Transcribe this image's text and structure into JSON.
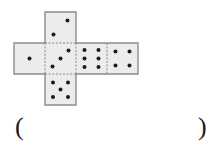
{
  "figure": {
    "style": {
      "face_fill": "#ececec",
      "outer_stroke": "#8c8c8c",
      "fold_stroke": "#7a7a7a",
      "pip_color": "#1a1a1a",
      "background": "#ffffff"
    },
    "geometry": {
      "cell_size": 31,
      "origin_x": 14,
      "origin_y": 12,
      "columns": 4,
      "rows": 3
    },
    "faces": [
      {
        "name": "face-top",
        "position": "top",
        "col": 1,
        "row": 0,
        "pips": 2,
        "pip_layout": "diagonal-two"
      },
      {
        "name": "face-left",
        "position": "left",
        "col": 0,
        "row": 1,
        "pips": 1,
        "pip_layout": "center-one"
      },
      {
        "name": "face-center",
        "position": "center",
        "col": 1,
        "row": 1,
        "pips": 3,
        "pip_layout": "diagonal-three"
      },
      {
        "name": "face-right-inner",
        "position": "right-inner",
        "col": 2,
        "row": 1,
        "pips": 6,
        "pip_layout": "two-by-three"
      },
      {
        "name": "face-right-outer",
        "position": "right-outer",
        "col": 3,
        "row": 1,
        "pips": 4,
        "pip_layout": "four-corners"
      },
      {
        "name": "face-bottom",
        "position": "bottom",
        "col": 1,
        "row": 2,
        "pips": 5,
        "pip_layout": "five-quincunx"
      }
    ]
  },
  "answer": {
    "open_paren": "(",
    "close_paren": ")",
    "value": ""
  }
}
